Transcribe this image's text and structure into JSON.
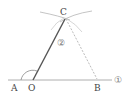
{
  "diagram": {
    "type": "geometric-construction",
    "points": {
      "A": {
        "label": "A",
        "x": 15,
        "y": 88
      },
      "O": {
        "label": "O",
        "x": 32,
        "y": 88
      },
      "B": {
        "label": "B",
        "x": 97,
        "y": 88
      },
      "C": {
        "label": "C",
        "x": 65,
        "y": 11
      }
    },
    "markers": {
      "line1": "①",
      "step2": "②"
    },
    "colors": {
      "solid_line": "#555555",
      "thin_line": "#999999",
      "dashed_line": "#aaaaaa",
      "arc": "#999999"
    }
  }
}
